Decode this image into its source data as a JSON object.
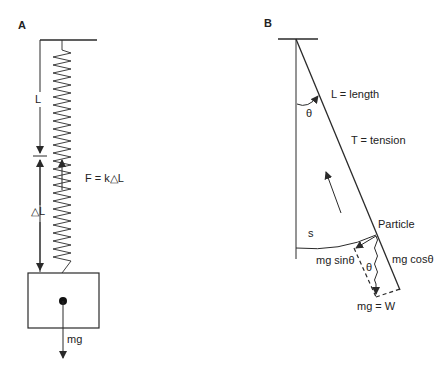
{
  "panels": {
    "a": {
      "label": "A",
      "length_label": "L",
      "delta_label": "△L",
      "force_label": "F = k△L",
      "weight_label": "mg"
    },
    "b": {
      "label": "B",
      "length_label": "L = length",
      "tension_label": "T = tension",
      "theta_top": "θ",
      "particle_label": "Particle",
      "arc_label": "s",
      "sin_label": "mg sinθ",
      "theta_bottom": "θ",
      "cos_label": "mg cosθ",
      "weight_label": "mg = W"
    }
  },
  "colors": {
    "stroke": "#2a2a2a",
    "text": "#222222"
  }
}
